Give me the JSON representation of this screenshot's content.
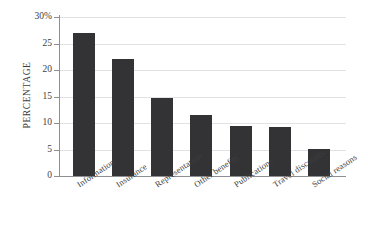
{
  "chart_data": {
    "type": "bar",
    "title": "",
    "xlabel": "",
    "ylabel": "PERCENTAGE",
    "categories": [
      "Information",
      "Insurance",
      "Representation",
      "Other benefits",
      "Publications",
      "Travel discounts",
      "Social reasons"
    ],
    "values": [
      27.0,
      22.0,
      14.7,
      11.6,
      9.5,
      9.3,
      5.1
    ],
    "ylim": [
      0,
      30
    ],
    "yticks": [
      0,
      5,
      10,
      15,
      20,
      25,
      30
    ],
    "ytick_labels": [
      "0",
      "5",
      "10",
      "15",
      "20",
      "25",
      "30%"
    ],
    "grid": true,
    "legend": false,
    "bar_color": "#333336",
    "gridline_color": "#e2e2e4",
    "axis_color": "#8f8f93",
    "background_color": "#ffffff"
  }
}
